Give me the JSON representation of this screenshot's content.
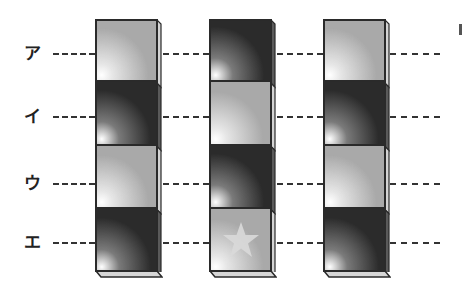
{
  "diagram": {
    "rows": [
      {
        "label": "ア",
        "y": 54
      },
      {
        "label": "イ",
        "y": 117
      },
      {
        "label": "ウ",
        "y": 184
      },
      {
        "label": "エ",
        "y": 243
      }
    ],
    "columns": [
      {
        "x": 95,
        "cells": [
          "light",
          "dark",
          "light",
          "dark"
        ],
        "star_cell": null
      },
      {
        "x": 209,
        "cells": [
          "dark",
          "light",
          "dark",
          "light"
        ],
        "star_cell": 3
      },
      {
        "x": 323,
        "cells": [
          "light",
          "dark",
          "light",
          "dark"
        ],
        "star_cell": null
      }
    ],
    "colors": {
      "light_cell": "#a9a9a9",
      "dark_cell": "#2b2b2b",
      "outline": "#2a2a2a",
      "dash_line": "#333333",
      "star": "#d9d9d9"
    },
    "icons": {
      "star": "star-icon"
    }
  }
}
